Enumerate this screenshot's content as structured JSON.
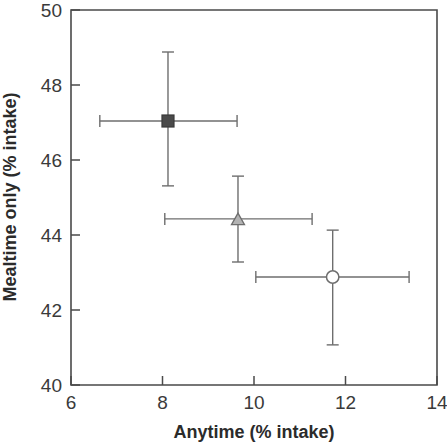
{
  "chart_data": {
    "type": "scatter",
    "title": "",
    "xlabel": "Anytime (% intake)",
    "ylabel": "Mealtime only (% intake)",
    "xlim": [
      6,
      14
    ],
    "ylim": [
      40,
      50
    ],
    "xticks": [
      6,
      8,
      10,
      12,
      14
    ],
    "yticks": [
      40,
      42,
      44,
      46,
      48,
      50
    ],
    "xtick_labels": [
      "6",
      "8",
      "10",
      "12",
      "14"
    ],
    "ytick_labels": [
      "40",
      "42",
      "44",
      "46",
      "48",
      "50"
    ],
    "grid": false,
    "legend": "none",
    "error_bars": "both",
    "points": [
      {
        "name": "filled-square",
        "marker": "square",
        "fill": "#4a4a4a",
        "stroke": "#3a3a3a",
        "x": 8.12,
        "y": 47.04,
        "x_err_low": 6.63,
        "x_err_high": 9.63,
        "y_err_low": 45.31,
        "y_err_high": 48.88
      },
      {
        "name": "gray-triangle",
        "marker": "triangle",
        "fill": "#b3b3b3",
        "stroke": "#6e6e6e",
        "x": 9.65,
        "y": 44.43,
        "x_err_low": 8.05,
        "x_err_high": 11.27,
        "y_err_low": 43.28,
        "y_err_high": 45.57
      },
      {
        "name": "open-circle",
        "marker": "circle",
        "fill": "#ffffff",
        "stroke": "#6e6e6e",
        "x": 11.72,
        "y": 42.88,
        "x_err_low": 10.04,
        "x_err_high": 13.39,
        "y_err_low": 41.07,
        "y_err_high": 44.13
      }
    ]
  },
  "geometry": {
    "plot_left": 71,
    "plot_right": 437,
    "plot_top": 10,
    "plot_bottom": 385
  },
  "colors": {
    "axis": "#4a4a4a",
    "error_bar": "#6e6e6e",
    "tick_text": "#3a3a3a",
    "axis_title": "#2b2b2b",
    "background": "#ffffff"
  }
}
